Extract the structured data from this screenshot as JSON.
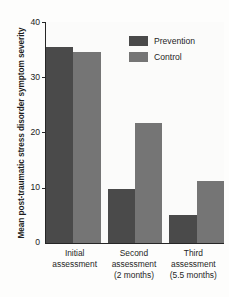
{
  "chart_data": {
    "type": "bar",
    "title": "",
    "xlabel": "",
    "ylabel": "Mean post-traumatic stress disorder symptom severity",
    "ylim": [
      0,
      40
    ],
    "yticks": [
      0,
      10,
      20,
      30,
      40
    ],
    "ytick_labels": [
      "0",
      "10",
      "20",
      "30",
      "40"
    ],
    "grid": false,
    "legend_position": "top-right",
    "categories": [
      "Initial assessment",
      "Second assessment (2 months)",
      "Third assessment (5.5 months)"
    ],
    "category_lines": [
      [
        "Initial",
        "assessment"
      ],
      [
        "Second",
        "assessment",
        "(2 months)"
      ],
      [
        "Third",
        "assessment",
        "(5.5 months)"
      ]
    ],
    "series": [
      {
        "name": "Prevention",
        "color": "#4a4a4a",
        "values": [
          35.4,
          9.7,
          5.1
        ]
      },
      {
        "name": "Control",
        "color": "#757575",
        "values": [
          34.6,
          21.7,
          11.3
        ]
      }
    ]
  },
  "legend": {
    "items": [
      {
        "label": "Prevention"
      },
      {
        "label": "Control"
      }
    ]
  },
  "axes": {
    "y_title": "Mean post-traumatic stress disorder symptom severity",
    "y_tick_40": "40",
    "y_tick_30": "30",
    "y_tick_20": "20",
    "y_tick_10": "10",
    "y_tick_0": "0"
  },
  "x_axis": {
    "group1_line1": "Initial",
    "group1_line2": "assessment",
    "group1_line3": "",
    "group2_line1": "Second",
    "group2_line2": "assessment",
    "group2_line3": "(2 months)",
    "group3_line1": "Third",
    "group3_line2": "assessment",
    "group3_line3": "(5.5 months)"
  }
}
